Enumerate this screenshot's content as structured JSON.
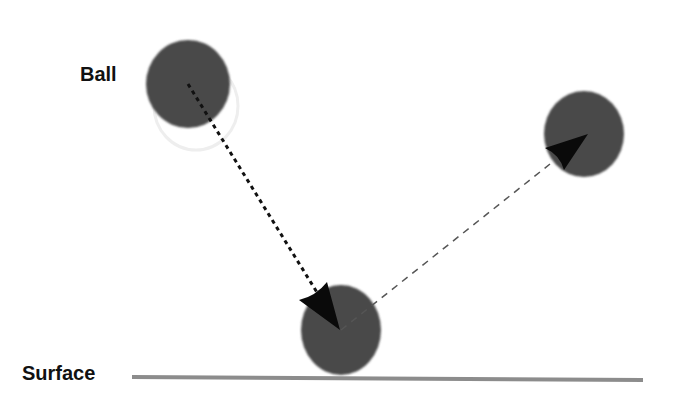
{
  "labels": {
    "ball": "Ball",
    "surface": "Surface"
  },
  "colors": {
    "ball": "#4a4a4a",
    "surface": "#8c8c8c",
    "arrow": "#0a0a0a",
    "incoming_line": "#111111",
    "outgoing_line": "#555555",
    "background": "#ffffff"
  },
  "diagram": {
    "balls": [
      {
        "name": "ball-initial",
        "cx": 188,
        "cy": 84,
        "rx": 42,
        "ry": 44
      },
      {
        "name": "ball-impact",
        "cx": 341,
        "cy": 330,
        "rx": 40,
        "ry": 45
      },
      {
        "name": "ball-rebound",
        "cx": 584,
        "cy": 134,
        "rx": 40,
        "ry": 43
      }
    ],
    "arrows": [
      {
        "name": "incoming-trajectory",
        "style": "dotted",
        "from": [
          188,
          84
        ],
        "to": [
          340,
          330
        ]
      },
      {
        "name": "rebound-trajectory",
        "style": "dashed",
        "from": [
          341,
          330
        ],
        "to": [
          588,
          135
        ]
      }
    ],
    "surface": {
      "x1": 132,
      "x2": 643,
      "y": 378
    }
  }
}
